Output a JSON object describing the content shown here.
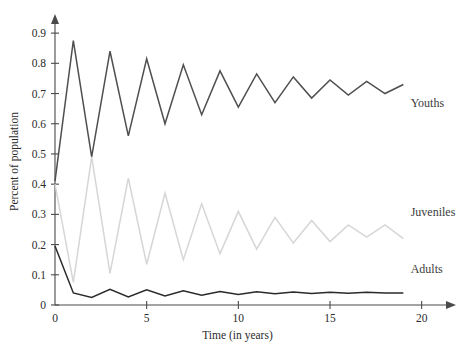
{
  "chart_data": {
    "type": "line",
    "title": "",
    "xlabel": "Time (in years)",
    "ylabel": "Percent of population",
    "xlim": [
      0,
      21
    ],
    "ylim": [
      0,
      0.95
    ],
    "grid": false,
    "legend_position": "inline-right",
    "x_ticks": [
      0,
      5,
      10,
      15,
      20
    ],
    "x_tick_labels": [
      "0",
      "5",
      "10",
      "15",
      "20"
    ],
    "y_ticks": [
      0,
      0.1,
      0.2,
      0.3,
      0.4,
      0.5,
      0.6,
      0.7,
      0.8,
      0.9
    ],
    "y_tick_labels": [
      "0",
      "0.1",
      "0.2",
      "0.3",
      "0.4",
      "0.5",
      "0.6",
      "0.7",
      "0.8",
      "0.9"
    ],
    "x": [
      0,
      1,
      2,
      3,
      4,
      5,
      6,
      7,
      8,
      9,
      10,
      11,
      12,
      13,
      14,
      15,
      16,
      17,
      18,
      19
    ],
    "series": [
      {
        "name": "Youths",
        "color": "#4f4f4f",
        "width": 1.5,
        "label_x": 19.4,
        "label_y": 0.655,
        "values": [
          0.41,
          0.875,
          0.49,
          0.84,
          0.56,
          0.815,
          0.6,
          0.795,
          0.63,
          0.775,
          0.655,
          0.765,
          0.67,
          0.755,
          0.685,
          0.745,
          0.695,
          0.74,
          0.7,
          0.73
        ]
      },
      {
        "name": "Juveniles",
        "color": "#d6d6d6",
        "width": 1.5,
        "label_x": 19.4,
        "label_y": 0.295,
        "values": [
          0.4,
          0.075,
          0.49,
          0.105,
          0.42,
          0.135,
          0.37,
          0.15,
          0.335,
          0.17,
          0.31,
          0.185,
          0.29,
          0.205,
          0.28,
          0.21,
          0.265,
          0.225,
          0.265,
          0.22
        ]
      },
      {
        "name": "Adults",
        "color": "#2a2a2a",
        "width": 1.5,
        "label_x": 19.4,
        "label_y": 0.105,
        "values": [
          0.195,
          0.04,
          0.025,
          0.052,
          0.027,
          0.05,
          0.03,
          0.047,
          0.032,
          0.045,
          0.035,
          0.044,
          0.037,
          0.043,
          0.038,
          0.042,
          0.039,
          0.042,
          0.04,
          0.04
        ]
      }
    ]
  }
}
